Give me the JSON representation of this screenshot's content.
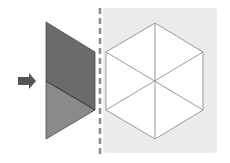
{
  "diagram": {
    "colors": {
      "background": "#ffffff",
      "panel": "#ebebeb",
      "piece_top": "#6b6b6b",
      "piece_bottom": "#8a8a8a",
      "piece_edge": "#4a4a4a",
      "arrow": "#555555",
      "dashed_line": "#8c8c8c",
      "hexagon_fill": "#ffffff",
      "hexagon_stroke": "#9a9a9a"
    },
    "arrow": {
      "direction": "right"
    },
    "piece": {
      "parts": 2
    },
    "hexagon": {
      "segments": 6
    }
  }
}
